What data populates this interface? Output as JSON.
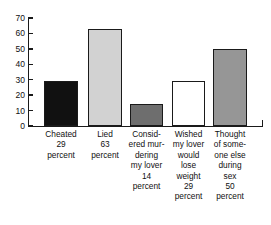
{
  "chart_data": {
    "type": "bar",
    "title": "",
    "subtitle": "",
    "xlabel": "",
    "ylabel": "",
    "ylim": [
      0,
      70
    ],
    "grid": false,
    "legend": false,
    "yticks": [
      0,
      10,
      20,
      30,
      40,
      50,
      60,
      70
    ],
    "ytick_labels": [
      "0",
      "10",
      "20",
      "30",
      "40",
      "50",
      "60",
      "70"
    ],
    "categories": [
      "Cheated",
      "Lied",
      "Considered murdering my lover",
      "Wished my lover would lose weight",
      "Thought of someone else during sex"
    ],
    "values": [
      29,
      63,
      14,
      29,
      50
    ],
    "value_unit": "percent",
    "bar_colors": [
      "#111111",
      "#d2d2d2",
      "#6e6e6e",
      "#ffffff",
      "#969696"
    ],
    "bar_edge_color": "#1a1a1a",
    "bars": [
      {
        "label_lines": [
          "Cheated",
          "29",
          "percent"
        ],
        "value": 29,
        "color": "#111111"
      },
      {
        "label_lines": [
          "Lied",
          "63",
          "percent"
        ],
        "value": 63,
        "color": "#d2d2d2"
      },
      {
        "label_lines": [
          "Consid-",
          "ered mur-",
          "dering",
          "my lover",
          "14",
          "percent"
        ],
        "value": 14,
        "color": "#6e6e6e"
      },
      {
        "label_lines": [
          "Wished",
          "my lover",
          "would",
          "lose",
          "weight",
          "29",
          "percent"
        ],
        "value": 29,
        "color": "#ffffff"
      },
      {
        "label_lines": [
          "Thought",
          "of some-",
          "one else",
          "during",
          "sex",
          "50",
          "percent"
        ],
        "value": 50,
        "color": "#969696"
      }
    ]
  }
}
